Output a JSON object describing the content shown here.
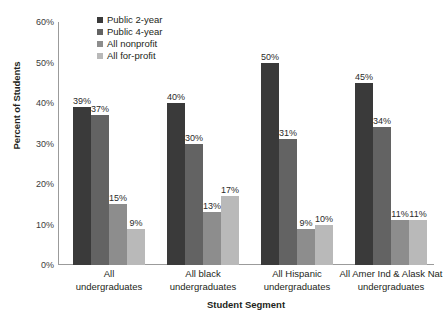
{
  "chart_data": {
    "type": "bar",
    "title": "",
    "xlabel": "Student Segment",
    "ylabel": "Percent of Students",
    "ylim": [
      0,
      60
    ],
    "ytick_labels": [
      "60%",
      "50%",
      "40%",
      "30%",
      "20%",
      "10%",
      "0%"
    ],
    "ytick_values": [
      60,
      50,
      40,
      30,
      20,
      10,
      0
    ],
    "grid": false,
    "legend_position": "top-left-inside",
    "categories": [
      "All undergraduates",
      "All black undergraduates",
      "All Hispanic undergraduates",
      "All Amer Ind & Alask Nat undergraduates"
    ],
    "category_lines": [
      [
        "All",
        "undergraduates"
      ],
      [
        "All black",
        "undergraduates"
      ],
      [
        "All Hispanic",
        "undergraduates"
      ],
      [
        "All Amer Ind & Alask Nat",
        "undergraduates"
      ]
    ],
    "series": [
      {
        "name": "Public 2-year",
        "color": "#3a3a3a",
        "values": [
          39,
          40,
          50,
          45
        ],
        "labels": [
          "39%",
          "40%",
          "50%",
          "45%"
        ]
      },
      {
        "name": "Public 4-year",
        "color": "#636363",
        "values": [
          37,
          30,
          31,
          34
        ],
        "labels": [
          "37%",
          "30%",
          "31%",
          "34%"
        ]
      },
      {
        "name": "All nonprofit",
        "color": "#8d8d8d",
        "values": [
          15,
          13,
          9,
          11
        ],
        "labels": [
          "15%",
          "13%",
          "9%",
          "11%"
        ]
      },
      {
        "name": "All for-profit",
        "color": "#b9b9b9",
        "values": [
          9,
          17,
          10,
          11
        ],
        "labels": [
          "9%",
          "17%",
          "10%",
          "11%"
        ]
      }
    ]
  },
  "axis": {
    "y_title": "Percent of Students",
    "x_title": "Student Segment"
  },
  "legend": {
    "items": [
      {
        "label": "Public 2-year",
        "color": "#3a3a3a"
      },
      {
        "label": "Public 4-year",
        "color": "#636363"
      },
      {
        "label": "All nonprofit",
        "color": "#8d8d8d"
      },
      {
        "label": "All for-profit",
        "color": "#b9b9b9"
      }
    ]
  }
}
